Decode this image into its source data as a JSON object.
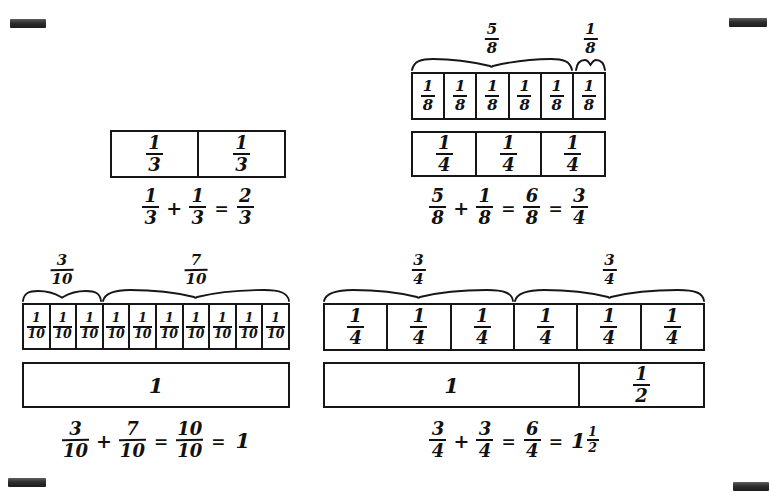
{
  "page": {
    "background_color": "#ffffff",
    "ink_color": "#111111",
    "corner_marks": [
      {
        "name": "top-left"
      },
      {
        "name": "top-right"
      },
      {
        "name": "bottom-left"
      },
      {
        "name": "bottom-right"
      }
    ]
  },
  "models": [
    {
      "id": "thirds",
      "name": "thirds-model",
      "rows": [
        {
          "name": "thirds-row",
          "cells": [
            {
              "num": "1",
              "den": "3"
            },
            {
              "num": "1",
              "den": "3"
            }
          ]
        }
      ],
      "braces": [],
      "equation": {
        "terms": [
          "1/3",
          "1/3",
          "2/3"
        ],
        "text": "1/3 + 1/3 = 2/3",
        "parts": [
          {
            "type": "fraction",
            "num": "1",
            "den": "3"
          },
          {
            "type": "op",
            "value": "+"
          },
          {
            "type": "fraction",
            "num": "1",
            "den": "3"
          },
          {
            "type": "op",
            "value": "="
          },
          {
            "type": "fraction",
            "num": "2",
            "den": "3"
          }
        ]
      }
    },
    {
      "id": "eighths",
      "name": "eighths-model",
      "rows": [
        {
          "name": "eighths-row",
          "cells": [
            {
              "num": "1",
              "den": "8"
            },
            {
              "num": "1",
              "den": "8"
            },
            {
              "num": "1",
              "den": "8"
            },
            {
              "num": "1",
              "den": "8"
            },
            {
              "num": "1",
              "den": "8"
            },
            {
              "num": "1",
              "den": "8"
            }
          ]
        },
        {
          "name": "fourths-row",
          "cells": [
            {
              "num": "1",
              "den": "4"
            },
            {
              "num": "1",
              "den": "4"
            },
            {
              "num": "1",
              "den": "4"
            }
          ]
        }
      ],
      "braces": [
        {
          "name": "brace-five-eighths",
          "num": "5",
          "den": "8",
          "spans_cells": 5
        },
        {
          "name": "brace-one-eighth",
          "num": "1",
          "den": "8",
          "spans_cells": 1
        }
      ],
      "equation": {
        "terms": [
          "5/8",
          "1/8",
          "6/8",
          "3/4"
        ],
        "text": "5/8 + 1/8 = 6/8 = 3/4",
        "parts": [
          {
            "type": "fraction",
            "num": "5",
            "den": "8"
          },
          {
            "type": "op",
            "value": "+"
          },
          {
            "type": "fraction",
            "num": "1",
            "den": "8"
          },
          {
            "type": "op",
            "value": "="
          },
          {
            "type": "fraction",
            "num": "6",
            "den": "8"
          },
          {
            "type": "op",
            "value": "="
          },
          {
            "type": "fraction",
            "num": "3",
            "den": "4"
          }
        ]
      }
    },
    {
      "id": "tenths",
      "name": "tenths-model",
      "rows": [
        {
          "name": "tenths-row",
          "cells": [
            {
              "num": "1",
              "den": "10"
            },
            {
              "num": "1",
              "den": "10"
            },
            {
              "num": "1",
              "den": "10"
            },
            {
              "num": "1",
              "den": "10"
            },
            {
              "num": "1",
              "den": "10"
            },
            {
              "num": "1",
              "den": "10"
            },
            {
              "num": "1",
              "den": "10"
            },
            {
              "num": "1",
              "den": "10"
            },
            {
              "num": "1",
              "den": "10"
            },
            {
              "num": "1",
              "den": "10"
            }
          ]
        },
        {
          "name": "whole-row",
          "cells": [
            {
              "whole": "1"
            }
          ]
        }
      ],
      "braces": [
        {
          "name": "brace-three-tenths",
          "num": "3",
          "den": "10",
          "spans_cells": 3
        },
        {
          "name": "brace-seven-tenths",
          "num": "7",
          "den": "10",
          "spans_cells": 7
        }
      ],
      "equation": {
        "terms": [
          "3/10",
          "7/10",
          "10/10",
          "1"
        ],
        "text": "3/10 + 7/10 = 10/10 = 1",
        "parts": [
          {
            "type": "fraction",
            "num": "3",
            "den": "10"
          },
          {
            "type": "op",
            "value": "+"
          },
          {
            "type": "fraction",
            "num": "7",
            "den": "10"
          },
          {
            "type": "op",
            "value": "="
          },
          {
            "type": "fraction",
            "num": "10",
            "den": "10"
          },
          {
            "type": "op",
            "value": "="
          },
          {
            "type": "whole",
            "value": "1"
          }
        ]
      }
    },
    {
      "id": "fourths",
      "name": "fourths-model",
      "rows": [
        {
          "name": "fourths-row",
          "cells": [
            {
              "num": "1",
              "den": "4"
            },
            {
              "num": "1",
              "den": "4"
            },
            {
              "num": "1",
              "den": "4"
            },
            {
              "num": "1",
              "den": "4"
            },
            {
              "num": "1",
              "den": "4"
            },
            {
              "num": "1",
              "den": "4"
            }
          ]
        },
        {
          "name": "whole-and-half-row",
          "cells": [
            {
              "whole": "1",
              "width_units": 4
            },
            {
              "num": "1",
              "den": "2",
              "width_units": 2
            }
          ]
        }
      ],
      "braces": [
        {
          "name": "brace-three-fourths-left",
          "num": "3",
          "den": "4",
          "spans_cells": 3
        },
        {
          "name": "brace-three-fourths-right",
          "num": "3",
          "den": "4",
          "spans_cells": 3
        }
      ],
      "equation": {
        "terms": [
          "3/4",
          "3/4",
          "6/4",
          "1 1/2"
        ],
        "text": "3/4 + 3/4 = 6/4 = 1 1/2",
        "parts": [
          {
            "type": "fraction",
            "num": "3",
            "den": "4"
          },
          {
            "type": "op",
            "value": "+"
          },
          {
            "type": "fraction",
            "num": "3",
            "den": "4"
          },
          {
            "type": "op",
            "value": "="
          },
          {
            "type": "fraction",
            "num": "6",
            "den": "4"
          },
          {
            "type": "op",
            "value": "="
          },
          {
            "type": "mixed",
            "int": "1",
            "num": "1",
            "den": "2"
          }
        ]
      }
    }
  ]
}
